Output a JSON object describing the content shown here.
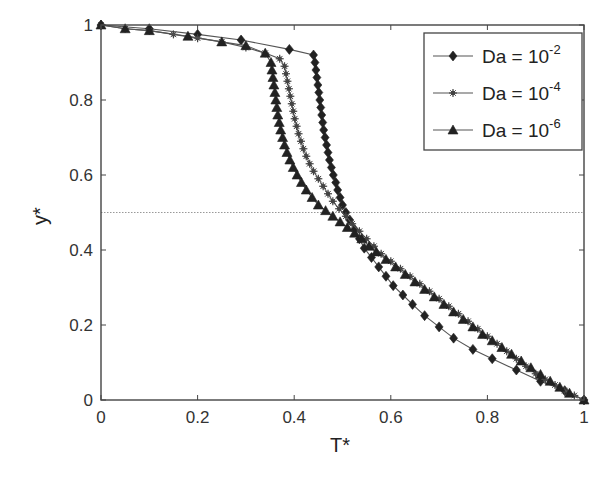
{
  "chart_data": {
    "type": "line",
    "title": "",
    "xlabel": "T*",
    "ylabel": "y*",
    "xlim": [
      0,
      1
    ],
    "ylim": [
      0,
      1
    ],
    "xticks": [
      0,
      0.2,
      0.4,
      0.6,
      0.8,
      1
    ],
    "yticks": [
      0,
      0.2,
      0.4,
      0.6,
      0.8,
      1
    ],
    "xtick_labels": [
      "0",
      "0.2",
      "0.4",
      "0.6",
      "0.8",
      "1"
    ],
    "ytick_labels": [
      "0",
      "0.2",
      "0.4",
      "0.6",
      "0.8",
      "1"
    ],
    "grid": false,
    "reference_line": {
      "y": 0.5,
      "style": "dotted"
    },
    "legend_position": "upper right",
    "series": [
      {
        "name": "Da = 10^-2",
        "label_base": "Da = 10",
        "label_exp": "-2",
        "marker": "diamond",
        "points": [
          [
            0.0,
            1.0
          ],
          [
            0.1,
            0.99
          ],
          [
            0.2,
            0.975
          ],
          [
            0.29,
            0.96
          ],
          [
            0.39,
            0.935
          ],
          [
            0.44,
            0.92
          ],
          [
            0.443,
            0.9
          ],
          [
            0.445,
            0.88
          ],
          [
            0.447,
            0.86
          ],
          [
            0.449,
            0.84
          ],
          [
            0.451,
            0.82
          ],
          [
            0.453,
            0.8
          ],
          [
            0.455,
            0.78
          ],
          [
            0.457,
            0.76
          ],
          [
            0.459,
            0.74
          ],
          [
            0.461,
            0.72
          ],
          [
            0.464,
            0.7
          ],
          [
            0.467,
            0.68
          ],
          [
            0.47,
            0.66
          ],
          [
            0.473,
            0.64
          ],
          [
            0.477,
            0.62
          ],
          [
            0.481,
            0.6
          ],
          [
            0.486,
            0.58
          ],
          [
            0.49,
            0.56
          ],
          [
            0.495,
            0.54
          ],
          [
            0.5,
            0.52
          ],
          [
            0.507,
            0.5
          ],
          [
            0.515,
            0.48
          ],
          [
            0.525,
            0.455
          ],
          [
            0.535,
            0.43
          ],
          [
            0.545,
            0.405
          ],
          [
            0.56,
            0.38
          ],
          [
            0.575,
            0.355
          ],
          [
            0.59,
            0.33
          ],
          [
            0.605,
            0.305
          ],
          [
            0.625,
            0.28
          ],
          [
            0.645,
            0.255
          ],
          [
            0.67,
            0.225
          ],
          [
            0.7,
            0.195
          ],
          [
            0.73,
            0.165
          ],
          [
            0.77,
            0.135
          ],
          [
            0.81,
            0.11
          ],
          [
            0.86,
            0.08
          ],
          [
            0.91,
            0.05
          ],
          [
            0.96,
            0.025
          ],
          [
            1.0,
            0.0
          ]
        ]
      },
      {
        "name": "Da = 10^-4",
        "label_base": "Da = 10",
        "label_exp": "-4",
        "marker": "star",
        "points": [
          [
            0.0,
            1.0
          ],
          [
            0.05,
            0.99
          ],
          [
            0.1,
            0.985
          ],
          [
            0.15,
            0.975
          ],
          [
            0.2,
            0.965
          ],
          [
            0.25,
            0.955
          ],
          [
            0.3,
            0.94
          ],
          [
            0.34,
            0.925
          ],
          [
            0.37,
            0.91
          ],
          [
            0.38,
            0.89
          ],
          [
            0.383,
            0.87
          ],
          [
            0.386,
            0.85
          ],
          [
            0.389,
            0.83
          ],
          [
            0.392,
            0.81
          ],
          [
            0.395,
            0.79
          ],
          [
            0.398,
            0.77
          ],
          [
            0.401,
            0.75
          ],
          [
            0.405,
            0.73
          ],
          [
            0.409,
            0.71
          ],
          [
            0.414,
            0.69
          ],
          [
            0.419,
            0.67
          ],
          [
            0.425,
            0.65
          ],
          [
            0.432,
            0.63
          ],
          [
            0.44,
            0.61
          ],
          [
            0.45,
            0.59
          ],
          [
            0.46,
            0.57
          ],
          [
            0.47,
            0.55
          ],
          [
            0.48,
            0.53
          ],
          [
            0.493,
            0.51
          ],
          [
            0.507,
            0.49
          ],
          [
            0.52,
            0.47
          ],
          [
            0.535,
            0.45
          ],
          [
            0.55,
            0.43
          ],
          [
            0.565,
            0.41
          ],
          [
            0.58,
            0.39
          ],
          [
            0.6,
            0.37
          ],
          [
            0.62,
            0.35
          ],
          [
            0.64,
            0.33
          ],
          [
            0.66,
            0.31
          ],
          [
            0.68,
            0.29
          ],
          [
            0.7,
            0.27
          ],
          [
            0.72,
            0.25
          ],
          [
            0.74,
            0.23
          ],
          [
            0.76,
            0.21
          ],
          [
            0.78,
            0.19
          ],
          [
            0.8,
            0.17
          ],
          [
            0.82,
            0.15
          ],
          [
            0.84,
            0.13
          ],
          [
            0.86,
            0.11
          ],
          [
            0.88,
            0.09
          ],
          [
            0.9,
            0.07
          ],
          [
            0.92,
            0.055
          ],
          [
            0.94,
            0.04
          ],
          [
            0.96,
            0.025
          ],
          [
            0.98,
            0.012
          ],
          [
            1.0,
            0.0
          ]
        ]
      },
      {
        "name": "Da = 10^-6",
        "label_base": "Da = 10",
        "label_exp": "-6",
        "marker": "triangle",
        "points": [
          [
            0.0,
            1.0
          ],
          [
            0.05,
            0.99
          ],
          [
            0.1,
            0.985
          ],
          [
            0.18,
            0.97
          ],
          [
            0.25,
            0.955
          ],
          [
            0.3,
            0.945
          ],
          [
            0.34,
            0.925
          ],
          [
            0.352,
            0.9
          ],
          [
            0.354,
            0.88
          ],
          [
            0.356,
            0.86
          ],
          [
            0.358,
            0.84
          ],
          [
            0.36,
            0.82
          ],
          [
            0.362,
            0.8
          ],
          [
            0.364,
            0.78
          ],
          [
            0.366,
            0.76
          ],
          [
            0.369,
            0.74
          ],
          [
            0.372,
            0.72
          ],
          [
            0.376,
            0.7
          ],
          [
            0.38,
            0.68
          ],
          [
            0.385,
            0.66
          ],
          [
            0.391,
            0.64
          ],
          [
            0.398,
            0.62
          ],
          [
            0.406,
            0.6
          ],
          [
            0.415,
            0.58
          ],
          [
            0.425,
            0.56
          ],
          [
            0.437,
            0.54
          ],
          [
            0.45,
            0.52
          ],
          [
            0.465,
            0.505
          ],
          [
            0.48,
            0.49
          ],
          [
            0.495,
            0.475
          ],
          [
            0.51,
            0.46
          ],
          [
            0.525,
            0.445
          ],
          [
            0.54,
            0.43
          ],
          [
            0.555,
            0.41
          ],
          [
            0.57,
            0.395
          ],
          [
            0.59,
            0.375
          ],
          [
            0.61,
            0.355
          ],
          [
            0.63,
            0.335
          ],
          [
            0.65,
            0.315
          ],
          [
            0.67,
            0.295
          ],
          [
            0.69,
            0.275
          ],
          [
            0.71,
            0.255
          ],
          [
            0.73,
            0.235
          ],
          [
            0.75,
            0.215
          ],
          [
            0.77,
            0.195
          ],
          [
            0.79,
            0.175
          ],
          [
            0.81,
            0.158
          ],
          [
            0.83,
            0.14
          ],
          [
            0.85,
            0.122
          ],
          [
            0.87,
            0.104
          ],
          [
            0.89,
            0.086
          ],
          [
            0.91,
            0.068
          ],
          [
            0.93,
            0.05
          ],
          [
            0.95,
            0.034
          ],
          [
            0.97,
            0.018
          ],
          [
            1.0,
            0.0
          ]
        ]
      }
    ]
  }
}
